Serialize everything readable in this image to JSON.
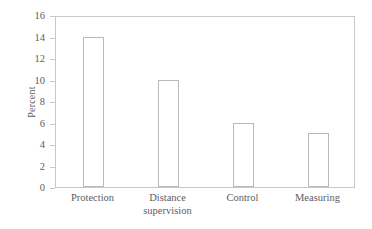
{
  "chart_data": {
    "type": "bar",
    "title": "",
    "xlabel": "",
    "ylabel": "Percent",
    "categories": [
      "Protection",
      "Distance supervision",
      "Control",
      "Measuring"
    ],
    "values": [
      14,
      10,
      6,
      5
    ],
    "ylim": [
      0,
      16
    ],
    "yticks": [
      0,
      2,
      4,
      6,
      8,
      10,
      12,
      14,
      16
    ],
    "ytick_labels": [
      "0",
      "2",
      "4",
      "6",
      "8",
      "10",
      "12",
      "14",
      "16"
    ],
    "grid": false,
    "legend": false,
    "bar_fill_color": "#ffffff",
    "bar_edge_color": "#b9b9b9",
    "axis_color": "#c8c8c8",
    "text_color": "#5d5d5d",
    "background_color": "#ffffff"
  },
  "axes": {
    "y_title": "Percent",
    "tick_0": "0",
    "tick_1": "2",
    "tick_2": "4",
    "tick_3": "6",
    "tick_4": "8",
    "tick_5": "10",
    "tick_6": "12",
    "tick_7": "14",
    "tick_8": "16"
  },
  "categories": {
    "cat_0": "Protection",
    "cat_1": "Distance\nsupervision",
    "cat_2": "Control",
    "cat_3": "Measuring"
  }
}
